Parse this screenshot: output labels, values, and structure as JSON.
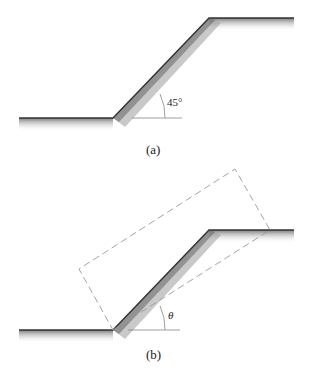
{
  "figures": [
    {
      "id": "a",
      "caption": "(a)",
      "angle_label": "45°",
      "ground_profile": {
        "left_ground": {
          "x1": 19,
          "y": 118,
          "x2": 113
        },
        "slope_top": {
          "x": 209,
          "y": 18
        },
        "right_ground_end_x": 294
      }
    },
    {
      "id": "b",
      "caption": "(b)",
      "angle_label": "θ",
      "ground_profile": {
        "left_ground": {
          "x1": 19,
          "y": 330,
          "x2": 113
        },
        "slope_top": {
          "x": 209,
          "y": 230
        },
        "right_ground_end_x": 294
      },
      "dashed_box": [
        [
          113,
          330
        ],
        [
          270,
          230
        ],
        [
          235,
          169
        ],
        [
          79,
          269
        ]
      ]
    }
  ],
  "colors": {
    "line": "#333333",
    "shade_dark": "#8a8a8a",
    "dash": "#9a9a9a",
    "background": "#ffffff"
  }
}
